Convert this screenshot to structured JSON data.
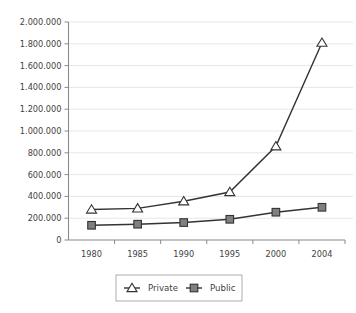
{
  "chart_data": {
    "type": "line",
    "title": "",
    "subtitle": "",
    "xlabel": "",
    "ylabel": "",
    "categories": [
      "1980",
      "1985",
      "1990",
      "1995",
      "2000",
      "2004"
    ],
    "x": [
      1980,
      1985,
      1990,
      1995,
      2000,
      2004
    ],
    "series": [
      {
        "name": "Private",
        "marker": "triangle-open",
        "marker_fill": "#ffffff",
        "line_color": "#333333",
        "values": [
          280000,
          290000,
          355000,
          440000,
          860000,
          1810000
        ]
      },
      {
        "name": "Public",
        "marker": "square-filled",
        "marker_fill": "#808080",
        "line_color": "#333333",
        "values": [
          135000,
          145000,
          160000,
          190000,
          255000,
          300000
        ]
      }
    ],
    "ylim": [
      0,
      2000000
    ],
    "ytick_values": [
      0,
      200000,
      400000,
      600000,
      800000,
      1000000,
      1200000,
      1400000,
      1600000,
      1800000,
      2000000
    ],
    "ytick_labels": [
      "0",
      "200.000",
      "400.000",
      "600.000",
      "800.000",
      "1.000.000",
      "1.200.000",
      "1.400.000",
      "1.600.000",
      "1.800.000",
      "2.000.000"
    ],
    "xtick_labels": [
      "1980",
      "1985",
      "1990",
      "1995",
      "2000",
      "2004"
    ],
    "grid": true,
    "grid_axis": "y",
    "grid_color": "#dcdcdc",
    "legend": {
      "position": "bottom",
      "bordered": true,
      "entries": [
        "Private",
        "Public"
      ]
    },
    "background_color": "#ffffff",
    "axis_color": "#8a8a8a"
  },
  "legend": {
    "items": [
      {
        "label": "Private"
      },
      {
        "label": "Public"
      }
    ]
  },
  "axes": {
    "y_labels": [
      "2.000.000",
      "1.800.000",
      "1.600.000",
      "1.400.000",
      "1.200.000",
      "1.000.000",
      "800.000",
      "600.000",
      "400.000",
      "200.000",
      "0"
    ],
    "x_labels": [
      "1980",
      "1985",
      "1990",
      "1995",
      "2000",
      "2004"
    ]
  }
}
